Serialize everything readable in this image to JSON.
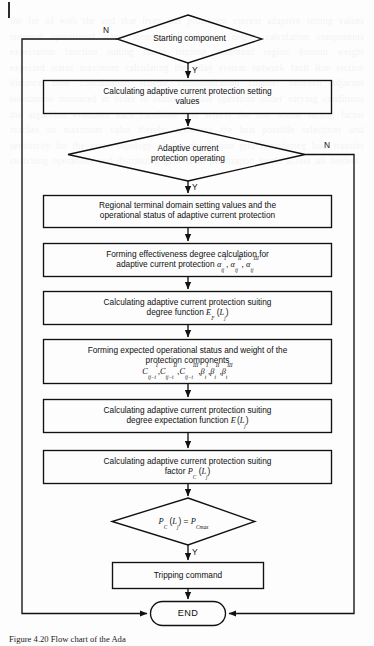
{
  "figure": {
    "type": "flowchart",
    "caption": "Figure 4.20  Flow chart of the Ada",
    "orientation": "top-to-bottom",
    "branch_labels": {
      "yes": "Y",
      "no": "N"
    }
  },
  "nodes": [
    {
      "id": "start_decision",
      "shape": "diamond",
      "lines": [
        "Starting component"
      ],
      "yes_label": "Y",
      "no_label": "N"
    },
    {
      "id": "calc_setting_values",
      "shape": "process",
      "lines": [
        "Calculating adaptive current protection setting",
        "values"
      ]
    },
    {
      "id": "protection_operating_decision",
      "shape": "diamond",
      "lines": [
        "Adaptive current",
        "protection operating"
      ],
      "yes_label": "Y",
      "no_label": "N"
    },
    {
      "id": "regional_terminal_domain",
      "shape": "process",
      "lines": [
        "Regional terminal domain setting values and the",
        "operational status of adaptive current protection"
      ]
    },
    {
      "id": "forming_effectiveness_degree",
      "shape": "process",
      "lines": [
        "Forming effectiveness degree calculation for",
        "adaptive current protection"
      ],
      "formula_html": "<span class=\"mi\">&alpha;</span><sub class=\"mi\">ij</sub><sup class=\"mi\">I</sup>, <span class=\"mi\">&alpha;</span><sub class=\"mi\">ij</sub><sup class=\"mi\">II</sup>, <span class=\"mi\">&alpha;</span><sub class=\"mi\">ij</sub><sup class=\"mi\">III</sup>",
      "formula_plain": "alpha_ij^I, alpha_ij^II, alpha_ij^III"
    },
    {
      "id": "calc_suiting_degree_function",
      "shape": "process",
      "lines": [
        "Calculating adaptive current protection suiting",
        "degree function"
      ],
      "formula_html": "<span class=\"mi\">E</span><sub class=\"mi\">F</sub> (<span class=\"mi\">L</span><sub class=\"mi\">j</sub>)",
      "formula_plain": "E_F (L_j)"
    },
    {
      "id": "forming_expected_status_weight",
      "shape": "process",
      "lines": [
        "Forming expected operational status and weight of the",
        "protection components"
      ],
      "formula_html": "<span class=\"mi\">C</span><sub class=\"mi\">ij&minus;t</sub><sup class=\"mi\">I</sup>,<span class=\"mi\">C</span><sub class=\"mi\">ij&minus;t</sub><sup class=\"mi\">II</sup>,<span class=\"mi\">C</span><sub class=\"mi\">ij&minus;t</sub><sup class=\"mi\">III</sup>,<span class=\"mi\">&beta;</span><sub class=\"mi\">t</sub><sup class=\"mi\">I</sup>,<span class=\"mi\">&beta;</span><sub class=\"mi\">t</sub><sup class=\"mi\">II</sup>,<span class=\"mi\">&beta;</span><sub class=\"mi\">t</sub><sup class=\"mi\">III</sup>",
      "formula_plain": "C_ij-t^I, C_ij-t^II, C_ij-t^III, beta_t^I, beta_t^II, beta_t^III"
    },
    {
      "id": "calc_degree_expectation_function",
      "shape": "process",
      "lines": [
        "Calculating adaptive current protection suiting",
        "degree expectation function"
      ],
      "formula_html": "<span class=\"mi\">E</span><sup class=\"mr\">&prime;</sup>(<span class=\"mi\">L</span><sub class=\"mi\">j</sub>)",
      "formula_plain": "E'(L_j)"
    },
    {
      "id": "calc_suiting_factor",
      "shape": "process",
      "lines": [
        "Calculating adaptive current protection suiting",
        "factor"
      ],
      "formula_html": "<span class=\"mi\">P</span><sub class=\"mi\">C</sub> (<span class=\"mi\">L</span><sub class=\"mi\">j</sub>)",
      "formula_plain": "P_C (L_j)"
    },
    {
      "id": "factor_max_decision",
      "shape": "diamond",
      "lines": [],
      "formula_html": "<span class=\"mi\">P</span><sub class=\"mi\">C</sub> (<span class=\"mi\">L</span><sub class=\"mi\">j</sub>) = <span class=\"mi\">P</span><sub class=\"mi\">Cmax</sub>",
      "formula_plain": "P_C (L_j) = P_Cmax",
      "yes_label": "Y"
    },
    {
      "id": "tripping_command",
      "shape": "process",
      "lines": [
        "Tripping command"
      ]
    },
    {
      "id": "end_terminal",
      "shape": "stadium",
      "lines": [
        "END"
      ]
    }
  ],
  "edges": [
    {
      "from": "start_decision",
      "to": "calc_setting_values",
      "label": "Y"
    },
    {
      "from": "start_decision",
      "to": "end_terminal",
      "label": "N",
      "route": "left"
    },
    {
      "from": "calc_setting_values",
      "to": "protection_operating_decision",
      "label": ""
    },
    {
      "from": "protection_operating_decision",
      "to": "regional_terminal_domain",
      "label": "Y"
    },
    {
      "from": "protection_operating_decision",
      "to": "end_terminal",
      "label": "N",
      "route": "right"
    },
    {
      "from": "regional_terminal_domain",
      "to": "forming_effectiveness_degree",
      "label": ""
    },
    {
      "from": "forming_effectiveness_degree",
      "to": "calc_suiting_degree_function",
      "label": ""
    },
    {
      "from": "calc_suiting_degree_function",
      "to": "forming_expected_status_weight",
      "label": ""
    },
    {
      "from": "forming_expected_status_weight",
      "to": "calc_degree_expectation_function",
      "label": ""
    },
    {
      "from": "calc_degree_expectation_function",
      "to": "calc_suiting_factor",
      "label": ""
    },
    {
      "from": "calc_suiting_factor",
      "to": "factor_max_decision",
      "label": ""
    },
    {
      "from": "factor_max_decision",
      "to": "tripping_command",
      "label": "Y"
    },
    {
      "from": "tripping_command",
      "to": "end_terminal",
      "label": ""
    }
  ],
  "colors": {
    "stroke": "#111111",
    "text": "#101010",
    "background": "#fdfdfd"
  },
  "bleed_text": "the for of with the and that from this protection current adaptive setting values terminal operational status forming effectiveness degree calculation components expectation function suiting factor tripping command region domain weight expected status maximum calculating the relay system network fault line section distance zone coordination scheme communication channel between adjacent substations measured in order to obtain reliable operation under varying conditions the algorithm evaluates each candidate and selects the one whose suiting factor reaches its maximum value thereby achieving the best possible selectivity and sensitivity for the given topology of the distribution grid considering load transfer switching operations and distributed generation penetration levels across all feeders"
}
